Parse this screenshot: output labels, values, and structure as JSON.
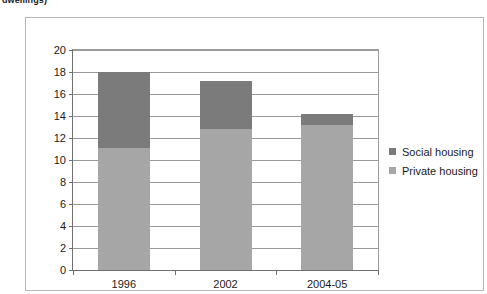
{
  "caption_fragment": "dwellings)",
  "colors": {
    "social_housing": "#7b7b7b",
    "private_housing": "#a6a6a6",
    "gridline": "#9a9a9a",
    "axis": "#6f6f6f",
    "frame": "#b7b7b7",
    "text": "#1a1a1a",
    "background": "#ffffff"
  },
  "legend": {
    "position": "right",
    "items": [
      {
        "label": "Social housing",
        "color": "#7b7b7b"
      },
      {
        "label": "Private housing",
        "color": "#a6a6a6"
      }
    ]
  },
  "chart_data": {
    "type": "bar",
    "stacked": true,
    "title": "",
    "subtitle": "",
    "xlabel": "",
    "ylabel": "",
    "categories": [
      "1996",
      "2002",
      "2004-05"
    ],
    "series": [
      {
        "name": "Private housing",
        "color": "#a6a6a6",
        "values": [
          11.1,
          12.8,
          13.2
        ]
      },
      {
        "name": "Social housing",
        "color": "#7b7b7b",
        "values": [
          6.9,
          4.4,
          1.0
        ]
      }
    ],
    "totals": [
      18.0,
      17.2,
      14.2
    ],
    "ylim": [
      0,
      20
    ],
    "ytick_step": 2,
    "yticks": [
      0,
      2,
      4,
      6,
      8,
      10,
      12,
      14,
      16,
      18,
      20
    ],
    "ytick_labels": [
      "0",
      "2",
      "4",
      "6",
      "8",
      "10",
      "12",
      "14",
      "16",
      "18",
      "20"
    ],
    "grid": true,
    "grid_axis": "y",
    "legend_position": "right"
  }
}
